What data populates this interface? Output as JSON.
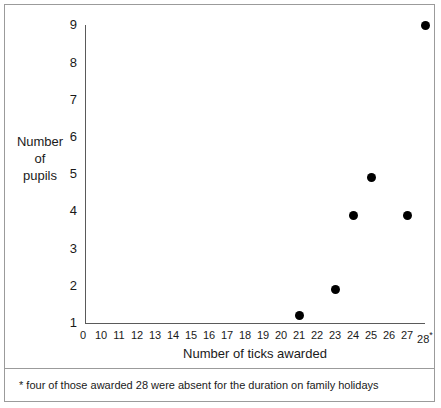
{
  "chart_data": {
    "type": "scatter",
    "title": "",
    "xlabel": "Number of ticks awarded",
    "ylabel": "Number of pupils",
    "ylabel_lines": [
      "Number",
      "of",
      "pupils"
    ],
    "x_tick_labels": [
      "0",
      "10",
      "11",
      "12",
      "13",
      "14",
      "15",
      "16",
      "17",
      "18",
      "19",
      "20",
      "21",
      "22",
      "23",
      "24",
      "25",
      "26",
      "27",
      "28"
    ],
    "y_tick_labels": [
      "1",
      "2",
      "3",
      "4",
      "5",
      "6",
      "7",
      "8",
      "9"
    ],
    "xlim": [
      0,
      28
    ],
    "ylim": [
      1,
      9
    ],
    "grid": false,
    "legend": null,
    "x_axis_suffix_marker": "*",
    "points": [
      {
        "x": 21,
        "y": 1.2
      },
      {
        "x": 23,
        "y": 1.9
      },
      {
        "x": 24,
        "y": 3.9
      },
      {
        "x": 25,
        "y": 4.9
      },
      {
        "x": 27,
        "y": 3.9
      },
      {
        "x": 28,
        "y": 9.0
      }
    ],
    "marker_color": "#000000",
    "axis_color": "#5a5a5a",
    "footnote": "* four of those awarded 28 were absent for the duration on family holidays"
  }
}
